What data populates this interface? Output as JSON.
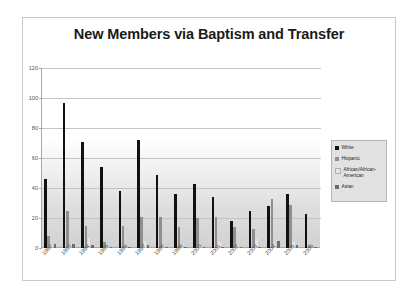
{
  "chart_data": {
    "type": "bar",
    "title": "New Members via Baptism and Transfer",
    "xlabel": "",
    "ylabel": "",
    "ylim": [
      0,
      120
    ],
    "yticks": [
      0,
      20,
      40,
      60,
      80,
      100,
      120
    ],
    "grid": true,
    "legend_position": "right",
    "categories": [
      "1992",
      "1993",
      "1994",
      "1995",
      "1996",
      "1997",
      "1998",
      "1999",
      "2000",
      "2001",
      "2002",
      "2003",
      "2004",
      "2005",
      "2006"
    ],
    "series": [
      {
        "name": "White",
        "color": "#111111",
        "values": [
          46,
          97,
          71,
          54,
          38,
          72,
          49,
          36,
          43,
          34,
          18,
          25,
          28,
          36,
          23
        ]
      },
      {
        "name": "Hispanic",
        "color": "#8f8f8f",
        "values": [
          8,
          25,
          15,
          4,
          15,
          21,
          21,
          14,
          20,
          21,
          14,
          13,
          33,
          29,
          2
        ]
      },
      {
        "name": "African/African-American",
        "color": "#e6e6e6",
        "values": [
          2,
          2,
          7,
          1,
          1,
          5,
          2,
          1,
          1,
          4,
          2,
          6,
          2,
          4,
          1
        ]
      },
      {
        "name": "Asian",
        "color": "#6d6d6d",
        "values": [
          3,
          3,
          2,
          1,
          1,
          2,
          1,
          1,
          1,
          1,
          1,
          1,
          5,
          2,
          1
        ]
      }
    ]
  },
  "legend": {
    "items": [
      {
        "label": "White"
      },
      {
        "label": "Hispanic"
      },
      {
        "label": "African/African-American"
      },
      {
        "label": "Asian"
      }
    ]
  }
}
